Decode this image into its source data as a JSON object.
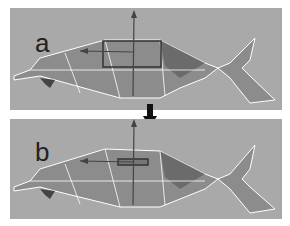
{
  "figure": {
    "panels": [
      {
        "label": "a",
        "description": "fish mesh with large scale manipulator box"
      },
      {
        "label": "b",
        "description": "fish mesh with scale manipulator box flattened"
      }
    ],
    "arrow": "down-arrow",
    "colors": {
      "background": "#a9a9a9",
      "mesh_fill": "#8c8c8c",
      "mesh_edges": "#ffffff",
      "manipulator": "#3a3a3a"
    }
  }
}
